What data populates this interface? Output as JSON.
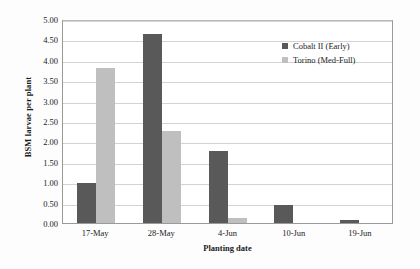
{
  "chart_data": {
    "type": "bar",
    "title": "",
    "xlabel": "Planting date",
    "ylabel": "BSM larvae per plant",
    "categories": [
      "17-May",
      "28-May",
      "4-Jun",
      "10-Jun",
      "19-Jun"
    ],
    "series": [
      {
        "name": "Cobalt II (Early)",
        "color": "#595959",
        "values": [
          0.97,
          4.63,
          1.77,
          0.43,
          0.08
        ]
      },
      {
        "name": "Torino (Med-Full)",
        "color": "#bfbfbf",
        "values": [
          3.8,
          2.25,
          0.13,
          0.0,
          0.0
        ]
      }
    ],
    "ylim": [
      0.0,
      5.0
    ],
    "ytick_step": 0.5,
    "ytick_labels": [
      "0.00",
      "0.50",
      "1.00",
      "1.50",
      "2.00",
      "2.50",
      "3.00",
      "3.50",
      "4.00",
      "4.50",
      "5.00"
    ],
    "grid": "horizontal",
    "legend_position": "inside-top-right"
  }
}
